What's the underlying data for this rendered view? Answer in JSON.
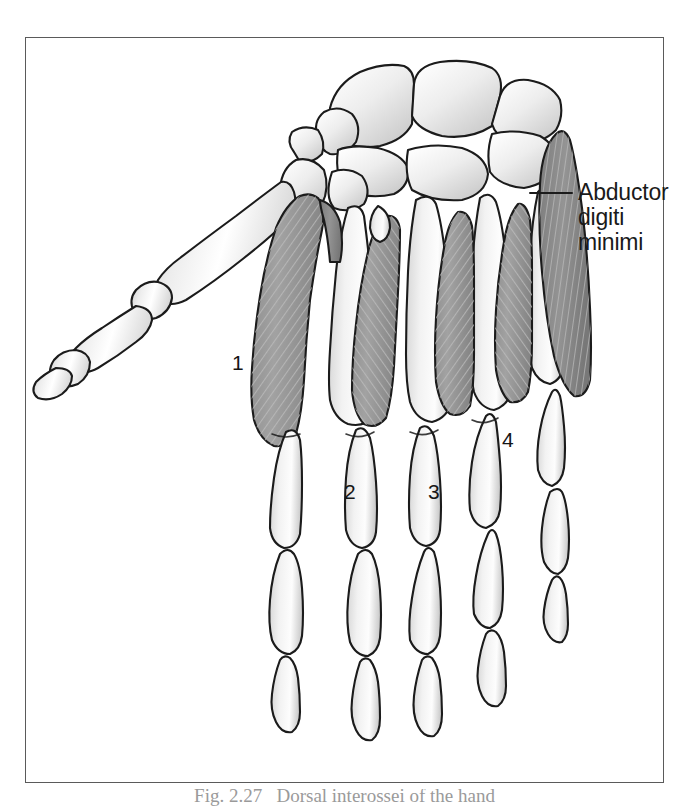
{
  "figure": {
    "kind": "anatomical-illustration",
    "view": "dorsal",
    "frame": {
      "border_color": "#5a5a5a",
      "background": "#ffffff"
    }
  },
  "annotations": {
    "leader_label": {
      "name": "abductor-digiti-minimi",
      "lines": [
        "Abductor",
        "digiti",
        "minimi"
      ],
      "text": "Abductor\ndigiti\nminimi",
      "leader_line": {
        "from_x": 530,
        "from_y": 193,
        "to_x": 572,
        "to_y": 193
      }
    },
    "numbered_labels": [
      {
        "id": "1",
        "text": "1",
        "refers_to": "first dorsal interosseous"
      },
      {
        "id": "2",
        "text": "2",
        "refers_to": "second dorsal interosseous"
      },
      {
        "id": "3",
        "text": "3",
        "refers_to": "third dorsal interosseous"
      },
      {
        "id": "4",
        "text": "4",
        "refers_to": "fourth dorsal interosseous"
      }
    ]
  },
  "caption": {
    "text": "Fig. 2.27   Dorsal interossei of the hand"
  },
  "palette": {
    "outline": "#1b1b1b",
    "bone_light": "#ffffff",
    "bone_mid": "#e4e4e4",
    "bone_shadow": "#c9c9c9",
    "muscle_fill": "#9a9a9a",
    "muscle_dark": "#7e7e7e",
    "muscle_hatch": "#b4b4b4",
    "frame": "#5a5a5a",
    "text": "#1a1a1a"
  }
}
